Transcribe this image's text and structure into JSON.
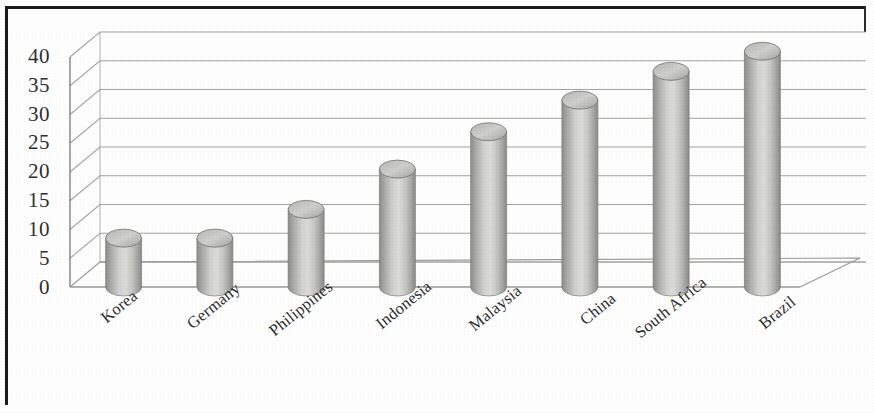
{
  "chart_data": {
    "type": "bar",
    "title": "",
    "subtitle": "",
    "xlabel": "",
    "ylabel": "",
    "categories": [
      "Korea",
      "Germany",
      "Philippines",
      "Indonesia",
      "Malaysia",
      "China",
      "South Africa",
      "Brazil"
    ],
    "values": [
      8.5,
      8.5,
      13.5,
      20.5,
      27,
      32.5,
      37.5,
      41
    ],
    "ylim": [
      0,
      42
    ],
    "ytick_labels": [
      "0",
      "5",
      "10",
      "15",
      "20",
      "25",
      "30",
      "35",
      "40"
    ],
    "ytick_values": [
      0,
      5,
      10,
      15,
      20,
      25,
      30,
      35,
      40
    ],
    "grid": true,
    "legend": false,
    "legend_position": "none",
    "style": "3d-cylinder",
    "series": [
      {
        "name": "",
        "values": [
          8.5,
          8.5,
          13.5,
          20.5,
          27,
          32.5,
          37.5,
          41
        ]
      }
    ],
    "annotations": []
  },
  "colors": {
    "bar_fill_light": "#d8d8d6",
    "bar_fill_mid": "#b9b9b6",
    "bar_fill_dark": "#8f8f8c",
    "gridline": "#9a9a98",
    "axis_line": "#6d6d6b",
    "frame": "#1b1b1b",
    "tick_text": "#2f2f2f",
    "background": "#ffffff"
  },
  "axis": {
    "y_tick_0": "0",
    "y_tick_5": "5",
    "y_tick_10": "10",
    "y_tick_15": "15",
    "y_tick_20": "20",
    "y_tick_25": "25",
    "y_tick_30": "30",
    "y_tick_35": "35",
    "y_tick_40": "40"
  },
  "x_labels": {
    "l0": "Korea",
    "l1": "Germany",
    "l2": "Philippines",
    "l3": "Indonesia",
    "l4": "Malaysia",
    "l5": "China",
    "l6": "South Africa",
    "l7": "Brazil"
  }
}
